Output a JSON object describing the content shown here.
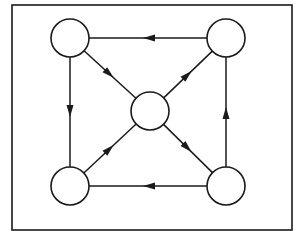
{
  "diagram": {
    "type": "directed-graph",
    "frame": {
      "x": 12,
      "y": 5,
      "width": 280,
      "height": 225,
      "stroke": "#1a1a1a"
    },
    "node_style": {
      "radius": 19,
      "fill": "#ffffff",
      "stroke": "#1a1a1a"
    },
    "nodes": [
      {
        "id": "top-left",
        "x": 70,
        "y": 38
      },
      {
        "id": "top-right",
        "x": 226,
        "y": 38
      },
      {
        "id": "center",
        "x": 150,
        "y": 111
      },
      {
        "id": "bottom-left",
        "x": 70,
        "y": 186
      },
      {
        "id": "bottom-right",
        "x": 226,
        "y": 186
      }
    ],
    "edges": [
      {
        "from": "top-right",
        "to": "top-left"
      },
      {
        "from": "top-left",
        "to": "bottom-left"
      },
      {
        "from": "bottom-right",
        "to": "top-right"
      },
      {
        "from": "bottom-right",
        "to": "bottom-left"
      },
      {
        "from": "top-left",
        "to": "center"
      },
      {
        "from": "center",
        "to": "top-right"
      },
      {
        "from": "bottom-left",
        "to": "center"
      },
      {
        "from": "center",
        "to": "bottom-right"
      }
    ],
    "edge_color": "#1a1a1a"
  }
}
